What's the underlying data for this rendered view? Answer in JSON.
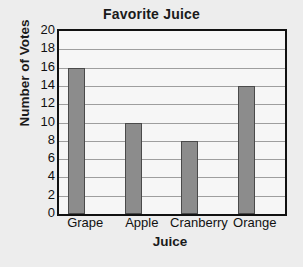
{
  "chart_data": {
    "type": "bar",
    "title": "Favorite Juice",
    "xlabel": "Juice",
    "ylabel": "Number of Votes",
    "categories": [
      "Grape",
      "Apple",
      "Cranberry",
      "Orange"
    ],
    "values": [
      16,
      10,
      8,
      14
    ],
    "ylim": [
      0,
      20
    ],
    "ytick_step": 2,
    "ytick_labels": [
      "20",
      "18",
      "16",
      "14",
      "12",
      "10",
      "8",
      "6",
      "4",
      "2",
      "0"
    ],
    "grid": true,
    "legend": "none",
    "series": [
      {
        "name": "Number of Votes",
        "values": [
          16,
          10,
          8,
          14
        ]
      }
    ],
    "colors": {
      "bar_fill": "#8c8c8c",
      "bar_stroke": "#4a4a4a",
      "frame": "#111111",
      "gridline": "#9e9e9e",
      "plot_background": "#f6f6f6",
      "page_background": "#ededed",
      "text": "#111111"
    }
  }
}
